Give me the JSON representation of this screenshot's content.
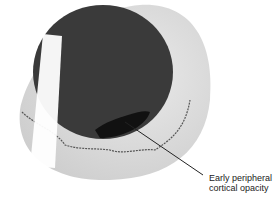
{
  "diagram": {
    "annotation": {
      "line1": "Early peripheral",
      "line2": "cortical opacity"
    },
    "colors": {
      "pupil": "#3a3a3a",
      "opacity": "#111111",
      "lens_shadow": "#d4d4d4",
      "highlight": "#ffffff",
      "leader_line": "#222222"
    }
  }
}
